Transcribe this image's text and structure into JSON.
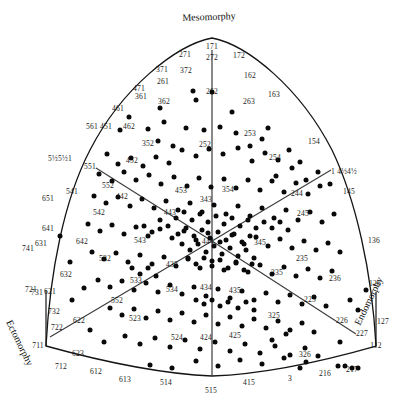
{
  "figure": {
    "type": "somatotype-distribution-triangle",
    "axis_titles": {
      "mesomorphy": "Mesomorphy",
      "ectomorphy": "Ectomorphy",
      "endomorphy": "Endomorphy"
    }
  },
  "chart_data": {
    "type": "scatter",
    "title": "Mesomorphy",
    "xlabel": "Endomorphy",
    "ylabel": "Ectomorphy",
    "grid": false,
    "legend": "none",
    "annotations": [
      {
        "text": "171",
        "x": 212,
        "y": 46
      },
      {
        "text": "271",
        "x": 185,
        "y": 54
      },
      {
        "text": "272",
        "x": 212,
        "y": 57
      },
      {
        "text": "172",
        "x": 239,
        "y": 55
      },
      {
        "text": "371",
        "x": 162,
        "y": 69
      },
      {
        "text": "372",
        "x": 186,
        "y": 70
      },
      {
        "text": "261",
        "x": 163,
        "y": 81
      },
      {
        "text": "162",
        "x": 250,
        "y": 75
      },
      {
        "text": "471",
        "x": 139,
        "y": 88
      },
      {
        "text": "361",
        "x": 141,
        "y": 96
      },
      {
        "text": "362",
        "x": 164,
        "y": 101
      },
      {
        "text": "262",
        "x": 212,
        "y": 91
      },
      {
        "text": "263",
        "x": 249,
        "y": 101
      },
      {
        "text": "163",
        "x": 274,
        "y": 94
      },
      {
        "text": "461",
        "x": 118,
        "y": 108
      },
      {
        "text": "561",
        "x": 92,
        "y": 126
      },
      {
        "text": "451",
        "x": 106,
        "y": 126
      },
      {
        "text": "462",
        "x": 129,
        "y": 126
      },
      {
        "text": "352",
        "x": 148,
        "y": 143
      },
      {
        "text": "252",
        "x": 205,
        "y": 144
      },
      {
        "text": "253",
        "x": 250,
        "y": 133
      },
      {
        "text": "254",
        "x": 275,
        "y": 157
      },
      {
        "text": "154",
        "x": 314,
        "y": 141
      },
      {
        "text": "5½5½1",
        "x": 60,
        "y": 158
      },
      {
        "text": "551",
        "x": 90,
        "y": 166
      },
      {
        "text": "452",
        "x": 132,
        "y": 160
      },
      {
        "text": "453",
        "x": 181,
        "y": 190
      },
      {
        "text": "354",
        "x": 228,
        "y": 189
      },
      {
        "text": "343",
        "x": 206,
        "y": 199
      },
      {
        "text": "552",
        "x": 108,
        "y": 185
      },
      {
        "text": "442",
        "x": 122,
        "y": 196
      },
      {
        "text": "541",
        "x": 72,
        "y": 191
      },
      {
        "text": "651",
        "x": 48,
        "y": 198
      },
      {
        "text": "542",
        "x": 99,
        "y": 212
      },
      {
        "text": "443",
        "x": 170,
        "y": 212
      },
      {
        "text": "1 4½4½",
        "x": 344,
        "y": 171
      },
      {
        "text": "244",
        "x": 297,
        "y": 193
      },
      {
        "text": "145",
        "x": 349,
        "y": 191
      },
      {
        "text": "245",
        "x": 303,
        "y": 213
      },
      {
        "text": "136",
        "x": 374,
        "y": 240
      },
      {
        "text": "641",
        "x": 48,
        "y": 228
      },
      {
        "text": "642",
        "x": 82,
        "y": 241
      },
      {
        "text": "741",
        "x": 28,
        "y": 248
      },
      {
        "text": "631",
        "x": 41,
        "y": 243
      },
      {
        "text": "543",
        "x": 140,
        "y": 240
      },
      {
        "text": "444",
        "x": 208,
        "y": 241
      },
      {
        "text": "345",
        "x": 260,
        "y": 242
      },
      {
        "text": "532",
        "x": 105,
        "y": 258
      },
      {
        "text": "632",
        "x": 66,
        "y": 274
      },
      {
        "text": "235",
        "x": 302,
        "y": 258
      },
      {
        "text": "433",
        "x": 172,
        "y": 264
      },
      {
        "text": "335",
        "x": 277,
        "y": 272
      },
      {
        "text": "236",
        "x": 335,
        "y": 278
      },
      {
        "text": "126",
        "x": 375,
        "y": 283
      },
      {
        "text": "533",
        "x": 136,
        "y": 280
      },
      {
        "text": "534",
        "x": 172,
        "y": 289
      },
      {
        "text": "434",
        "x": 206,
        "y": 287
      },
      {
        "text": "435",
        "x": 235,
        "y": 290
      },
      {
        "text": "721",
        "x": 31,
        "y": 289
      },
      {
        "text": "731",
        "x": 37,
        "y": 292
      },
      {
        "text": "621",
        "x": 50,
        "y": 291
      },
      {
        "text": "552b",
        "x": 117,
        "y": 300
      },
      {
        "text": "732",
        "x": 54,
        "y": 311
      },
      {
        "text": "622",
        "x": 79,
        "y": 320
      },
      {
        "text": "722",
        "x": 57,
        "y": 327
      },
      {
        "text": "711",
        "x": 38,
        "y": 345
      },
      {
        "text": "225",
        "x": 310,
        "y": 299
      },
      {
        "text": "325",
        "x": 274,
        "y": 315
      },
      {
        "text": "226",
        "x": 342,
        "y": 320
      },
      {
        "text": "227",
        "x": 362,
        "y": 333
      },
      {
        "text": "127",
        "x": 383,
        "y": 321
      },
      {
        "text": "112",
        "x": 376,
        "y": 345
      },
      {
        "text": "217",
        "x": 352,
        "y": 369
      },
      {
        "text": "523",
        "x": 135,
        "y": 318
      },
      {
        "text": "623",
        "x": 78,
        "y": 353
      },
      {
        "text": "524",
        "x": 177,
        "y": 337
      },
      {
        "text": "424",
        "x": 206,
        "y": 337
      },
      {
        "text": "425",
        "x": 235,
        "y": 335
      },
      {
        "text": "326",
        "x": 305,
        "y": 354
      },
      {
        "text": "216",
        "x": 325,
        "y": 373
      },
      {
        "text": "3",
        "x": 290,
        "y": 378
      },
      {
        "text": "712",
        "x": 61,
        "y": 366
      },
      {
        "text": "612",
        "x": 96,
        "y": 371
      },
      {
        "text": "613",
        "x": 125,
        "y": 379
      },
      {
        "text": "514",
        "x": 166,
        "y": 382
      },
      {
        "text": "515",
        "x": 211,
        "y": 390
      },
      {
        "text": "415",
        "x": 249,
        "y": 382
      }
    ],
    "points": [
      [
        129,
        117
      ],
      [
        148,
        129
      ],
      [
        164,
        122
      ],
      [
        193,
        91
      ],
      [
        212,
        92
      ],
      [
        158,
        141
      ],
      [
        173,
        146
      ],
      [
        186,
        128
      ],
      [
        204,
        130
      ],
      [
        220,
        127
      ],
      [
        236,
        133
      ],
      [
        250,
        146
      ],
      [
        262,
        139
      ],
      [
        107,
        154
      ],
      [
        118,
        164
      ],
      [
        131,
        158
      ],
      [
        143,
        166
      ],
      [
        156,
        157
      ],
      [
        169,
        163
      ],
      [
        182,
        150
      ],
      [
        196,
        156
      ],
      [
        209,
        149
      ],
      [
        223,
        154
      ],
      [
        238,
        148
      ],
      [
        252,
        161
      ],
      [
        265,
        153
      ],
      [
        278,
        160
      ],
      [
        289,
        150
      ],
      [
        300,
        162
      ],
      [
        99,
        174
      ],
      [
        112,
        181
      ],
      [
        124,
        172
      ],
      [
        136,
        180
      ],
      [
        149,
        175
      ],
      [
        161,
        184
      ],
      [
        174,
        177
      ],
      [
        187,
        186
      ],
      [
        199,
        178
      ],
      [
        211,
        187
      ],
      [
        224,
        179
      ],
      [
        236,
        188
      ],
      [
        248,
        180
      ],
      [
        260,
        190
      ],
      [
        272,
        181
      ],
      [
        284,
        192
      ],
      [
        296,
        183
      ],
      [
        308,
        194
      ],
      [
        320,
        186
      ],
      [
        94,
        196
      ],
      [
        106,
        203
      ],
      [
        118,
        197
      ],
      [
        130,
        206
      ],
      [
        142,
        199
      ],
      [
        154,
        208
      ],
      [
        166,
        201
      ],
      [
        178,
        210
      ],
      [
        190,
        203
      ],
      [
        202,
        212
      ],
      [
        214,
        205
      ],
      [
        226,
        214
      ],
      [
        238,
        206
      ],
      [
        250,
        216
      ],
      [
        262,
        208
      ],
      [
        274,
        218
      ],
      [
        286,
        210
      ],
      [
        298,
        220
      ],
      [
        310,
        212
      ],
      [
        322,
        222
      ],
      [
        334,
        214
      ],
      [
        88,
        224
      ],
      [
        100,
        231
      ],
      [
        112,
        225
      ],
      [
        124,
        234
      ],
      [
        136,
        227
      ],
      [
        148,
        236
      ],
      [
        160,
        229
      ],
      [
        172,
        238
      ],
      [
        184,
        231
      ],
      [
        196,
        240
      ],
      [
        208,
        233
      ],
      [
        220,
        242
      ],
      [
        232,
        235
      ],
      [
        244,
        244
      ],
      [
        256,
        237
      ],
      [
        268,
        246
      ],
      [
        280,
        239
      ],
      [
        292,
        248
      ],
      [
        304,
        241
      ],
      [
        316,
        250
      ],
      [
        328,
        243
      ],
      [
        340,
        252
      ],
      [
        92,
        252
      ],
      [
        104,
        259
      ],
      [
        116,
        253
      ],
      [
        128,
        262
      ],
      [
        140,
        255
      ],
      [
        152,
        264
      ],
      [
        164,
        257
      ],
      [
        176,
        266
      ],
      [
        188,
        259
      ],
      [
        200,
        268
      ],
      [
        212,
        261
      ],
      [
        224,
        270
      ],
      [
        236,
        263
      ],
      [
        248,
        272
      ],
      [
        260,
        265
      ],
      [
        272,
        274
      ],
      [
        284,
        267
      ],
      [
        296,
        276
      ],
      [
        308,
        269
      ],
      [
        320,
        278
      ],
      [
        332,
        271
      ],
      [
        98,
        280
      ],
      [
        110,
        287
      ],
      [
        122,
        281
      ],
      [
        134,
        290
      ],
      [
        146,
        283
      ],
      [
        158,
        292
      ],
      [
        170,
        285
      ],
      [
        182,
        294
      ],
      [
        194,
        287
      ],
      [
        206,
        296
      ],
      [
        218,
        289
      ],
      [
        230,
        298
      ],
      [
        242,
        291
      ],
      [
        254,
        300
      ],
      [
        266,
        293
      ],
      [
        278,
        302
      ],
      [
        290,
        295
      ],
      [
        302,
        304
      ],
      [
        314,
        297
      ],
      [
        326,
        306
      ],
      [
        110,
        308
      ],
      [
        122,
        315
      ],
      [
        134,
        309
      ],
      [
        146,
        318
      ],
      [
        158,
        311
      ],
      [
        170,
        320
      ],
      [
        182,
        313
      ],
      [
        194,
        322
      ],
      [
        206,
        315
      ],
      [
        218,
        324
      ],
      [
        230,
        317
      ],
      [
        242,
        326
      ],
      [
        254,
        319
      ],
      [
        266,
        328
      ],
      [
        278,
        321
      ],
      [
        290,
        330
      ],
      [
        302,
        323
      ],
      [
        314,
        332
      ],
      [
        125,
        336
      ],
      [
        140,
        344
      ],
      [
        155,
        338
      ],
      [
        170,
        347
      ],
      [
        185,
        340
      ],
      [
        200,
        349
      ],
      [
        215,
        342
      ],
      [
        230,
        351
      ],
      [
        245,
        344
      ],
      [
        260,
        353
      ],
      [
        275,
        346
      ],
      [
        290,
        355
      ],
      [
        305,
        348
      ],
      [
        150,
        365
      ],
      [
        172,
        368
      ],
      [
        196,
        361
      ],
      [
        218,
        366
      ],
      [
        240,
        360
      ],
      [
        262,
        364
      ],
      [
        284,
        358
      ],
      [
        306,
        362
      ],
      [
        338,
        366
      ],
      [
        345,
        366
      ],
      [
        178,
        234
      ],
      [
        186,
        228
      ],
      [
        194,
        236
      ],
      [
        202,
        230
      ],
      [
        210,
        238
      ],
      [
        218,
        232
      ],
      [
        226,
        240
      ],
      [
        234,
        234
      ],
      [
        242,
        242
      ],
      [
        250,
        236
      ],
      [
        182,
        244
      ],
      [
        190,
        250
      ],
      [
        198,
        244
      ],
      [
        206,
        252
      ],
      [
        214,
        246
      ],
      [
        222,
        254
      ],
      [
        230,
        248
      ],
      [
        238,
        256
      ],
      [
        246,
        250
      ],
      [
        254,
        258
      ],
      [
        188,
        258
      ],
      [
        196,
        264
      ],
      [
        204,
        258
      ],
      [
        212,
        266
      ],
      [
        220,
        260
      ],
      [
        228,
        268
      ],
      [
        236,
        262
      ],
      [
        244,
        270
      ],
      [
        252,
        264
      ],
      [
        176,
        218
      ],
      [
        184,
        212
      ],
      [
        192,
        220
      ],
      [
        200,
        214
      ],
      [
        208,
        222
      ],
      [
        216,
        216
      ],
      [
        224,
        224
      ],
      [
        232,
        218
      ],
      [
        240,
        226
      ],
      [
        248,
        220
      ],
      [
        256,
        228
      ],
      [
        168,
        226
      ],
      [
        160,
        220
      ],
      [
        152,
        232
      ],
      [
        144,
        226
      ],
      [
        264,
        222
      ],
      [
        272,
        228
      ],
      [
        280,
        222
      ],
      [
        288,
        230
      ],
      [
        196,
        300
      ],
      [
        204,
        304
      ],
      [
        212,
        300
      ],
      [
        220,
        306
      ],
      [
        228,
        302
      ],
      [
        238,
        308
      ],
      [
        246,
        302
      ],
      [
        254,
        310
      ],
      [
        132,
        268
      ],
      [
        140,
        274
      ],
      [
        148,
        268
      ],
      [
        156,
        276
      ],
      [
        60,
        236
      ],
      [
        70,
        262
      ],
      [
        84,
        288
      ],
      [
        72,
        300
      ],
      [
        90,
        330
      ],
      [
        104,
        342
      ],
      [
        350,
        300
      ],
      [
        358,
        310
      ],
      [
        366,
        290
      ],
      [
        340,
        342
      ],
      [
        352,
        368
      ],
      [
        358,
        368
      ],
      [
        318,
        356
      ],
      [
        300,
        368
      ],
      [
        272,
        340
      ],
      [
        286,
        334
      ],
      [
        120,
        130
      ],
      [
        160,
        108
      ],
      [
        196,
        100
      ],
      [
        232,
        112
      ],
      [
        268,
        128
      ],
      [
        276,
        176
      ],
      [
        292,
        168
      ],
      [
        306,
        180
      ],
      [
        318,
        172
      ],
      [
        330,
        184
      ]
    ]
  }
}
